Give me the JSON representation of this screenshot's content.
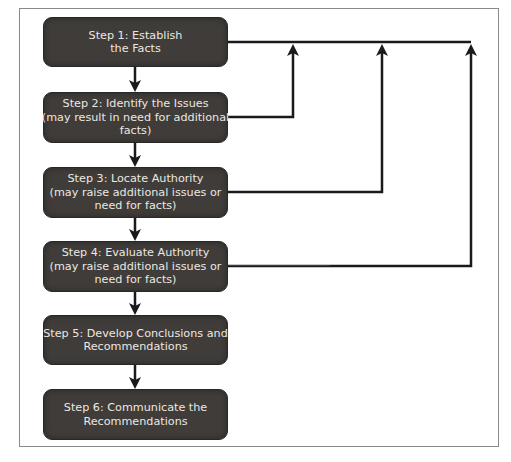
{
  "diagram": {
    "type": "flowchart",
    "colors": {
      "box_fill": "#3f3c39",
      "box_text": "#ece8e2",
      "arrow": "#1a1a1a",
      "frame": "#8a8a8a",
      "step4_feedback_line_tint": "#8b1a1a"
    },
    "steps": [
      {
        "id": "step1",
        "lines": [
          "Step 1: Establish",
          "the Facts"
        ]
      },
      {
        "id": "step2",
        "lines": [
          "Step 2: Identify the Issues",
          "(may result in need for additional",
          "facts)"
        ]
      },
      {
        "id": "step3",
        "lines": [
          "Step 3: Locate Authority",
          "(may raise additional issues or",
          "need for facts)"
        ]
      },
      {
        "id": "step4",
        "lines": [
          "Step 4: Evaluate Authority",
          "(may raise additional issues or",
          "need for facts)"
        ]
      },
      {
        "id": "step5",
        "lines": [
          "Step 5: Develop Conclusions and",
          "Recommendations"
        ]
      },
      {
        "id": "step6",
        "lines": [
          "Step 6: Communicate the",
          "Recommendations"
        ]
      }
    ],
    "edges": [
      {
        "from": "step1",
        "to": "step2",
        "kind": "sequence"
      },
      {
        "from": "step2",
        "to": "step3",
        "kind": "sequence"
      },
      {
        "from": "step3",
        "to": "step4",
        "kind": "sequence"
      },
      {
        "from": "step4",
        "to": "step5",
        "kind": "sequence"
      },
      {
        "from": "step5",
        "to": "step6",
        "kind": "sequence"
      },
      {
        "from": "step2",
        "to": "step1",
        "kind": "feedback"
      },
      {
        "from": "step3",
        "to": "step1",
        "kind": "feedback"
      },
      {
        "from": "step4",
        "to": "step1",
        "kind": "feedback"
      }
    ]
  }
}
